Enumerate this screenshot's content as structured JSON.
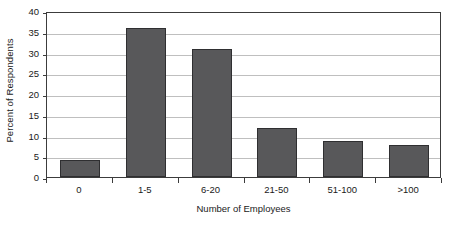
{
  "chart_data": {
    "type": "bar",
    "title": "",
    "subtitle": "",
    "xlabel": "Number of Employees",
    "ylabel": "Percent of Respondents",
    "categories": [
      "0",
      "1-5",
      "6-20",
      "21-50",
      "51-100",
      ">100"
    ],
    "values": [
      4.0,
      36.0,
      30.8,
      11.8,
      8.7,
      7.7
    ],
    "ylim": [
      0,
      40
    ],
    "ytick_step": 5,
    "yticks": [
      "0",
      "5",
      "10",
      "15",
      "20",
      "25",
      "30",
      "35",
      "40"
    ],
    "grid": true,
    "legend": "none",
    "bar_color": "#58585a",
    "bar_edge_color": "#2f2f31",
    "grid_color": "#bfbfbf",
    "axis_color": "#3c3c3c",
    "background": "#ffffff"
  }
}
